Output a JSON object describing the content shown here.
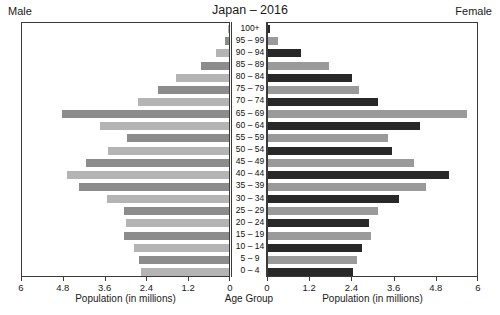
{
  "header": {
    "title": "Japan – 2016",
    "male_label": "Male",
    "female_label": "Female"
  },
  "axes": {
    "male_title": "Population (in millions)",
    "female_title": "Population (in millions)",
    "center_title": "Age Group",
    "male_ticks": [
      "6",
      "4.8",
      "3.6",
      "2.4",
      "1.2",
      "0"
    ],
    "female_ticks": [
      "0",
      "1.2",
      "2.4",
      "3.6",
      "4.8",
      "6"
    ],
    "tick_values": [
      0,
      1.2,
      2.4,
      3.6,
      4.8,
      6
    ]
  },
  "colors": {
    "male_light": "#b4b4b4",
    "male_dark": "#8c8c8c",
    "female_gray": "#9a9a9a",
    "female_dark": "#282828",
    "panel_border": "#3a3a3a",
    "background": "#ffffff",
    "text": "#111111"
  },
  "chart_data": {
    "type": "bar",
    "title": "Japan – 2016",
    "subtitle": "",
    "xlabel": "Population (in millions)",
    "ylabel": "Age Group",
    "xlim": [
      0,
      6
    ],
    "grid": false,
    "legend": [
      "Male",
      "Female"
    ],
    "legend_position": "top-corners",
    "orientation": "horizontal-pyramid",
    "categories": [
      "100+",
      "95 – 99",
      "90 – 94",
      "85 – 89",
      "80 – 84",
      "75 – 79",
      "70 – 74",
      "65 – 69",
      "60 – 64",
      "55 – 59",
      "50 – 54",
      "45 – 49",
      "40 – 44",
      "35 – 39",
      "30 – 34",
      "25 – 29",
      "20 – 24",
      "15 – 19",
      "10 – 14",
      "5 – 9",
      "0 – 4"
    ],
    "series": [
      {
        "name": "Male",
        "values": [
          0.01,
          0.12,
          0.38,
          0.82,
          1.55,
          2.05,
          2.65,
          4.85,
          3.75,
          2.95,
          3.5,
          4.15,
          4.7,
          4.35,
          3.55,
          3.05,
          3.0,
          3.05,
          2.75,
          2.6,
          2.55
        ]
      },
      {
        "name": "Female",
        "values": [
          0.07,
          0.3,
          0.95,
          1.75,
          2.4,
          2.6,
          3.15,
          5.7,
          4.35,
          3.45,
          3.55,
          4.2,
          5.2,
          4.55,
          3.75,
          3.15,
          2.9,
          2.95,
          2.7,
          2.55,
          2.45
        ]
      }
    ]
  }
}
